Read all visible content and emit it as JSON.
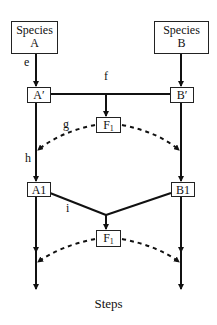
{
  "diagram": {
    "species_a": {
      "line1": "Species",
      "line2": "A"
    },
    "species_b": {
      "line1": "Species",
      "line2": "B"
    },
    "a_prime": "A′",
    "b_prime": "B′",
    "f1_top": {
      "main": "F",
      "sub": "1"
    },
    "f1_bottom": {
      "main": "F",
      "sub": "1"
    },
    "a1": "A1",
    "b1": "B1",
    "labels": {
      "e": "e",
      "f": "f",
      "g": "g",
      "h": "h",
      "i": "i"
    },
    "footer": "Steps"
  }
}
